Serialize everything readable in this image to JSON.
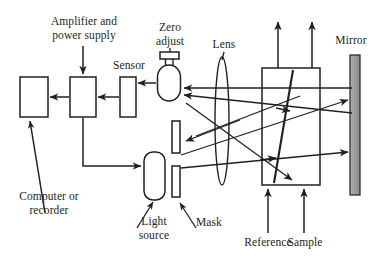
{
  "figure": {
    "type": "optical-instrument-schematic"
  },
  "labels": {
    "amplifier": "Amplifier and\npower supply",
    "zero_adjust": "Zero\nadjust",
    "sensor": "Sensor",
    "lens": "Lens",
    "mirror": "Mirror",
    "computer": "Computer or\nrecorder",
    "light_source": "Light\nsource",
    "mask": "Mask",
    "reference": "Reference",
    "sample": "Sample"
  },
  "components": {
    "computer_box": {
      "x": 20,
      "y": 77,
      "w": 28,
      "h": 40
    },
    "amplifier_box": {
      "x": 70,
      "y": 77,
      "w": 26,
      "h": 40
    },
    "sensor_box": {
      "x": 120,
      "y": 77,
      "w": 16,
      "h": 40
    },
    "detector_body": {
      "cx": 169,
      "cy": 83,
      "w": 23,
      "h": 36
    },
    "zero_adjust_knob": {
      "x": 160,
      "y": 52,
      "w": 19,
      "h": 7
    },
    "light_source": {
      "x": 144,
      "y": 152,
      "w": 21,
      "h": 48
    },
    "mask_upper": {
      "x": 172,
      "y": 121,
      "w": 8,
      "h": 32
    },
    "mask_lower": {
      "x": 172,
      "y": 166,
      "w": 8,
      "h": 31
    },
    "lens": {
      "cx": 222,
      "cy": 121,
      "rx": 7,
      "ry": 64
    },
    "cell_box": {
      "x": 262,
      "y": 68,
      "w": 58,
      "h": 117
    },
    "mirror": {
      "x": 350,
      "y": 55,
      "w": 10,
      "h": 140
    }
  },
  "colors": {
    "stroke": "#231f20",
    "text": "#231f20",
    "mirror_fill": "#9a9a9a",
    "background": "#ffffff"
  }
}
